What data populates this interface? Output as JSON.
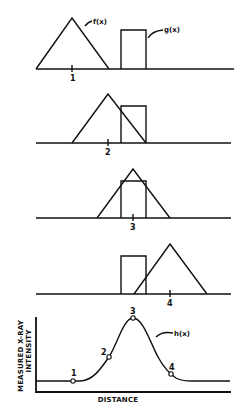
{
  "figure": {
    "function_labels": {
      "f": "f(x)",
      "g": "g(x)",
      "h": "h(x)"
    },
    "panels": [
      {
        "position_label": "1",
        "triangle_peak_x": 72,
        "baseline_y": 69
      },
      {
        "position_label": "2",
        "triangle_peak_x": 108,
        "baseline_y": 143
      },
      {
        "position_label": "3",
        "triangle_peak_x": 133,
        "baseline_y": 218
      },
      {
        "position_label": "4",
        "triangle_peak_x": 170,
        "baseline_y": 294
      }
    ],
    "rectangle": {
      "x_left": 121,
      "x_right": 146,
      "height": 39
    },
    "triangle": {
      "half_width": 37,
      "height": 51
    },
    "result_plot": {
      "y_axis_label_line1": "MEASURED X-RAY",
      "y_axis_label_line2": "INTENSITY",
      "x_axis_label": "DISTANCE",
      "points": [
        {
          "label": "1",
          "x": 73,
          "y": 381
        },
        {
          "label": "2",
          "x": 109,
          "y": 357
        },
        {
          "label": "3",
          "x": 133,
          "y": 318
        },
        {
          "label": "4",
          "x": 171,
          "y": 374
        }
      ]
    }
  },
  "colors": {
    "ink": "#111111",
    "background": "#ffffff"
  }
}
